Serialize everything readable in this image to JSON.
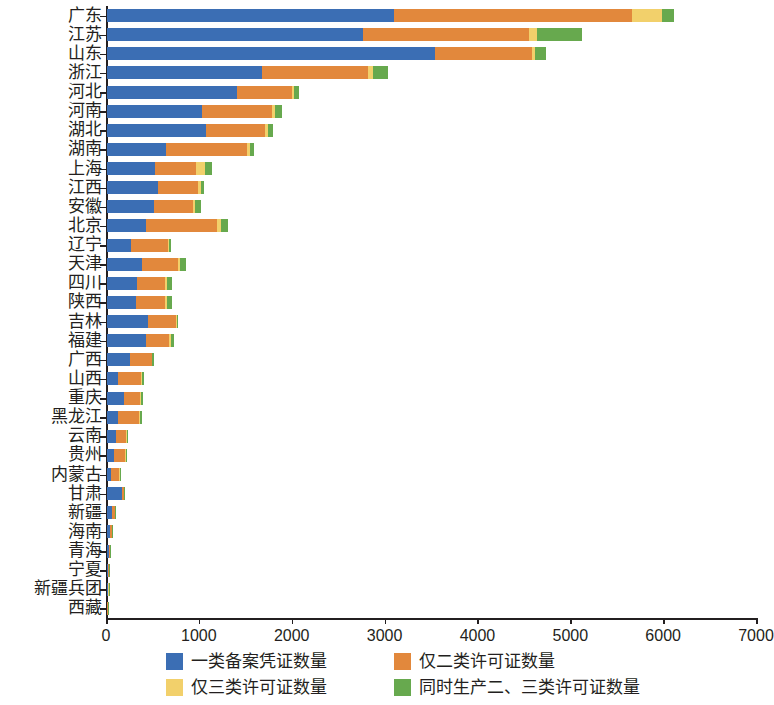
{
  "chart_data": {
    "type": "bar",
    "orientation": "horizontal",
    "stacked": true,
    "title": "",
    "xlabel": "",
    "ylabel": "",
    "xlim": [
      0,
      7000
    ],
    "xticks": [
      0,
      1000,
      2000,
      3000,
      4000,
      5000,
      6000,
      7000
    ],
    "grid": false,
    "legend_position": "bottom",
    "categories": [
      "广东",
      "江苏",
      "山东",
      "浙江",
      "河北",
      "河南",
      "湖北",
      "湖南",
      "上海",
      "江西",
      "安徽",
      "北京",
      "辽宁",
      "天津",
      "四川",
      "陕西",
      "吉林",
      "福建",
      "广西",
      "山西",
      "重庆",
      "黑龙江",
      "云南",
      "贵州",
      "内蒙古",
      "甘肃",
      "新疆",
      "海南",
      "青海",
      "宁夏",
      "新疆兵团",
      "西藏"
    ],
    "series": [
      {
        "name": "一类备案凭证数量",
        "color": "#3b6eb4",
        "values": [
          3090,
          2760,
          3530,
          1670,
          1400,
          1020,
          1070,
          640,
          520,
          550,
          510,
          420,
          260,
          380,
          320,
          310,
          440,
          420,
          250,
          120,
          180,
          120,
          100,
          80,
          40,
          160,
          55,
          30,
          18,
          12,
          10,
          5
        ]
      },
      {
        "name": "仅二类许可证数量",
        "color": "#e2883c",
        "values": [
          2560,
          1790,
          1050,
          1140,
          590,
          760,
          630,
          870,
          440,
          430,
          420,
          760,
          400,
          390,
          300,
          320,
          300,
          250,
          230,
          250,
          180,
          230,
          110,
          110,
          90,
          20,
          30,
          20,
          12,
          10,
          6,
          4
        ]
      },
      {
        "name": "仅三类许可证数量",
        "color": "#f2d06b",
        "values": [
          330,
          80,
          30,
          50,
          20,
          30,
          30,
          30,
          100,
          30,
          20,
          50,
          10,
          20,
          30,
          20,
          10,
          20,
          10,
          10,
          10,
          10,
          10,
          10,
          10,
          5,
          5,
          5,
          3,
          3,
          2,
          2
        ]
      },
      {
        "name": "同时生产二、三类许可证数量",
        "color": "#67a94e",
        "values": [
          130,
          490,
          120,
          170,
          60,
          70,
          60,
          40,
          70,
          30,
          60,
          70,
          20,
          60,
          50,
          50,
          20,
          30,
          20,
          20,
          20,
          20,
          10,
          10,
          5,
          5,
          5,
          5,
          3,
          3,
          2,
          2
        ]
      }
    ],
    "legend": [
      {
        "label": "一类备案凭证数量",
        "color": "#3b6eb4"
      },
      {
        "label": "仅二类许可证数量",
        "color": "#e2883c"
      },
      {
        "label": "仅三类许可证数量",
        "color": "#f2d06b"
      },
      {
        "label": "同时生产二、三类许可证数量",
        "color": "#67a94e"
      }
    ]
  }
}
